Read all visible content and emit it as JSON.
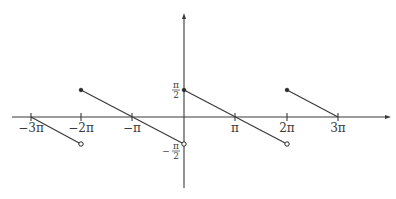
{
  "diagram": {
    "x_axis": {
      "ticks": [
        {
          "label": "−3π",
          "value": "-3pi"
        },
        {
          "label": "−2π",
          "value": "-2pi"
        },
        {
          "label": "−π",
          "value": "-pi"
        },
        {
          "label": "π",
          "value": "pi"
        },
        {
          "label": "2π",
          "value": "2pi"
        },
        {
          "label": "3π",
          "value": "3pi"
        }
      ]
    },
    "y_axis": {
      "ticks": [
        {
          "label_num": "π",
          "label_den": "2",
          "sign": "",
          "value": "pi/2"
        },
        {
          "label_num": "π",
          "label_den": "2",
          "sign": "−",
          "value": "-pi/2"
        }
      ]
    },
    "segments": [
      {
        "from": [
          "-3pi",
          "0"
        ],
        "to": [
          "-2pi",
          "-pi/2"
        ],
        "start": "none",
        "end": "open"
      },
      {
        "from": [
          "-2pi",
          "pi/2"
        ],
        "to": [
          "0",
          "-pi/2"
        ],
        "start": "closed",
        "end": "open"
      },
      {
        "from": [
          "0",
          "pi/2"
        ],
        "to": [
          "2pi",
          "-pi/2"
        ],
        "start": "closed",
        "end": "open"
      },
      {
        "from": [
          "2pi",
          "pi/2"
        ],
        "to": [
          "3pi",
          "0"
        ],
        "start": "closed",
        "end": "none"
      }
    ]
  }
}
